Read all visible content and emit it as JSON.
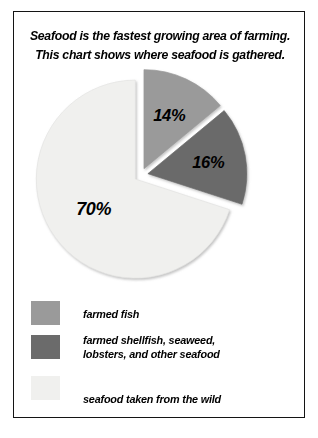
{
  "card": {
    "border_color": "#141414",
    "background": "#ffffff"
  },
  "header": {
    "line1": "Seafood is the fastest growing area of farming.",
    "line2": "This chart shows where seafood is gathered."
  },
  "chart_data": {
    "type": "pie",
    "title": "Seafood is the fastest growing area of farming. This chart shows where seafood is gathered.",
    "categories": [
      "farmed fish",
      "farmed shellfish, seaweed, lobsters, and other seafood",
      "seafood taken from the wild"
    ],
    "values": [
      14,
      16,
      70
    ],
    "value_labels": [
      "14%",
      "16%",
      "70%"
    ],
    "unit": "%",
    "colors": [
      "#9a9a9a",
      "#6b6b6b",
      "#f0f0ee"
    ],
    "exploded": true,
    "legend_position": "bottom-left",
    "grid": false,
    "xlabel": "",
    "ylabel": ""
  },
  "pie": {
    "slice1_label": "14%",
    "slice2_label": "16%",
    "slice3_label": "70%"
  },
  "legend": {
    "items": [
      {
        "color": "#9a9a9a",
        "line1": "farmed fish",
        "line2": ""
      },
      {
        "color": "#6b6b6b",
        "line1": "farmed shellfish, seaweed,",
        "line2": "lobsters, and other seafood"
      },
      {
        "color": "#f0f0ee",
        "line1": "seafood taken from the wild",
        "line2": ""
      }
    ]
  }
}
